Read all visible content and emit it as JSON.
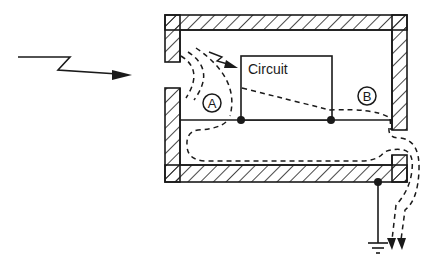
{
  "diagram": {
    "type": "shielded-enclosure-interference-paths",
    "circuit_label": "Circuit",
    "point_a_label": "A",
    "point_b_label": "B",
    "incoming_signal": "zigzag-arrow",
    "ground": "ground-symbol",
    "colors": {
      "ink": "#1a1a1a",
      "background": "#ffffff"
    }
  }
}
